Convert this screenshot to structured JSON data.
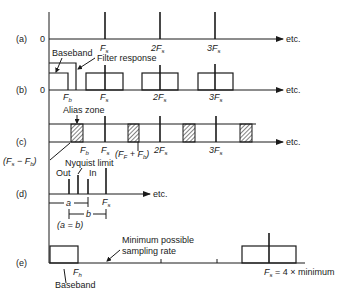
{
  "figure": {
    "rows": {
      "a": {
        "label": "(a)",
        "zero": "0",
        "ticks": [
          "F",
          "2F",
          "3F"
        ],
        "tick_sub": "s",
        "etc": "etc."
      },
      "b": {
        "label": "(b)",
        "zero": "0",
        "baseband": "Baseband",
        "filter": "Filter response",
        "fb": "F",
        "fb_sub": "b",
        "ticks": [
          "F",
          "2F",
          "3F"
        ],
        "tick_sub": "s",
        "etc": "etc."
      },
      "c": {
        "label": "(c)",
        "alias": "Alias zone",
        "fb": "F",
        "fb_sub": "b",
        "ticks": [
          "F",
          "2F",
          "3F"
        ],
        "tick_sub": "s",
        "minus": "(F",
        "minus_mid": " − F",
        "minus_end": ")",
        "plus": "(F",
        "plus_mid": " + F",
        "plus_end": ")",
        "etc": "etc."
      },
      "d": {
        "label": "(d)",
        "nyquist": "Nyquist limit",
        "out": "Out",
        "in": "In",
        "fs": "F",
        "fs_sub": "s",
        "a": "a",
        "b": "b",
        "ab": "(a = b)",
        "etc": "etc."
      },
      "e": {
        "label": "(e)",
        "min_line1": "Minimum possible",
        "min_line2": "sampling rate",
        "fb": "F",
        "fb_sub": "h",
        "baseband": "Baseband",
        "fs": "F",
        "fs_sub": "s",
        "fs_rest": " = 4 × minimum"
      }
    },
    "colors": {
      "ink": "#1a1a1a",
      "background": "#ffffff"
    }
  }
}
